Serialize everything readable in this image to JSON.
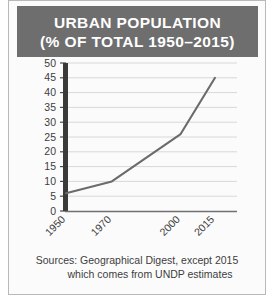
{
  "figure": {
    "title_line_1": "URBAN POPULATION",
    "title_line_2": "(% OF TOTAL 1950–2015)",
    "title_bar_color": "#6e6e6e",
    "title_text_color": "#ffffff",
    "caption_line_1": "Sources: Geographical Digest, except 2015",
    "caption_line_2": "which comes from UNDP estimates"
  },
  "chart_data": {
    "type": "line",
    "title": "URBAN POPULATION (% OF TOTAL 1950–2015)",
    "xlabel": "",
    "ylabel": "",
    "x": [
      1950,
      1970,
      2000,
      2015
    ],
    "categories": [
      "1950",
      "1970",
      "2000",
      "2015"
    ],
    "values": [
      6,
      10,
      26,
      45
    ],
    "series": [
      {
        "name": "Urban population (% of total)",
        "values": [
          6,
          10,
          26,
          45
        ]
      }
    ],
    "ylim": [
      0,
      50
    ],
    "yticks": [
      0,
      5,
      10,
      15,
      20,
      25,
      30,
      35,
      40,
      45,
      50
    ],
    "ytick_labels": [
      "0",
      "5",
      "10",
      "15",
      "20",
      "25",
      "30",
      "35",
      "40",
      "45",
      "50"
    ],
    "xtick_labels": [
      "1950",
      "1970",
      "2000",
      "2015"
    ],
    "grid": true,
    "grid_axis": "y",
    "legend": false,
    "legend_position": "none",
    "line_color": "#6b6b6b",
    "grid_color": "#d8d8d8",
    "axis_color": "#3a3a3a",
    "plot_background": "#fbfbfb",
    "xtick_label_rotation": -45
  }
}
